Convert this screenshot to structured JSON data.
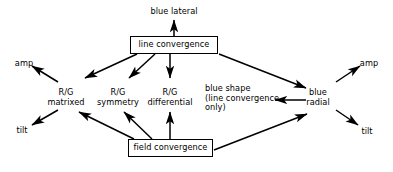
{
  "diagram": {
    "type": "flow-diagram",
    "title": "",
    "canvas": {
      "width": 393,
      "height": 172,
      "background": "#ffffff",
      "stroke": "#000000"
    },
    "boxes": [
      {
        "id": "line-convergence",
        "label": "line convergence",
        "x": 130,
        "y": 36,
        "w": 88,
        "h": 18
      },
      {
        "id": "field-convergence",
        "label": "field convergence",
        "x": 128,
        "y": 139,
        "w": 85,
        "h": 18
      }
    ],
    "labels": [
      {
        "id": "blue-lateral",
        "text": "blue lateral",
        "x": 174,
        "y": 7,
        "align": "center"
      },
      {
        "id": "amp-left",
        "text": "amp",
        "x": 24,
        "y": 59,
        "align": "center"
      },
      {
        "id": "tilt-left",
        "text": "tilt",
        "x": 22,
        "y": 126,
        "align": "center"
      },
      {
        "id": "amp-right",
        "text": "amp",
        "x": 369,
        "y": 59,
        "align": "center"
      },
      {
        "id": "tilt-right",
        "text": "tilt",
        "x": 367,
        "y": 127,
        "align": "center"
      },
      {
        "id": "rg-matrixed",
        "text": "R/G\nmatrixed",
        "x": 66,
        "y": 88,
        "align": "center"
      },
      {
        "id": "rg-symmetry",
        "text": "R/G\nsymmetry",
        "x": 118,
        "y": 88,
        "align": "center"
      },
      {
        "id": "rg-differential",
        "text": "R/G\ndifferential",
        "x": 170,
        "y": 88,
        "align": "center"
      },
      {
        "id": "blue-shape",
        "text": "blue shape\n(line convergence\nonly)",
        "x": 205,
        "y": 84,
        "align": "left"
      },
      {
        "id": "blue-radial",
        "text": "blue\nradial",
        "x": 318,
        "y": 88,
        "align": "center"
      }
    ],
    "edges": [
      {
        "id": "line-convergence-to-blue-lateral",
        "from": "line-convergence",
        "to": "blue-lateral",
        "x1": 174,
        "y1": 36,
        "x2": 174,
        "y2": 19
      },
      {
        "id": "line-convergence-to-rg-matrixed",
        "from": "line-convergence",
        "to": "rg-matrixed",
        "x1": 137,
        "y1": 54,
        "x2": 84,
        "y2": 79
      },
      {
        "id": "line-convergence-to-rg-symmetry",
        "from": "line-convergence",
        "to": "rg-symmetry",
        "x1": 155,
        "y1": 54,
        "x2": 128,
        "y2": 79
      },
      {
        "id": "line-convergence-to-rg-differential",
        "from": "line-convergence",
        "to": "rg-differential",
        "x1": 170,
        "y1": 54,
        "x2": 170,
        "y2": 79
      },
      {
        "id": "line-convergence-to-blue-radial",
        "from": "line-convergence",
        "to": "blue-radial",
        "x1": 219,
        "y1": 54,
        "x2": 307,
        "y2": 88
      },
      {
        "id": "field-convergence-to-rg-matrixed",
        "from": "field-convergence",
        "to": "rg-matrixed",
        "x1": 133,
        "y1": 139,
        "x2": 78,
        "y2": 112
      },
      {
        "id": "field-convergence-to-rg-symmetry",
        "from": "field-convergence",
        "to": "rg-symmetry",
        "x1": 151,
        "y1": 139,
        "x2": 123,
        "y2": 112
      },
      {
        "id": "field-convergence-to-rg-differential",
        "from": "field-convergence",
        "to": "rg-differential",
        "x1": 170,
        "y1": 139,
        "x2": 170,
        "y2": 112
      },
      {
        "id": "field-convergence-to-blue-radial",
        "from": "field-convergence",
        "to": "blue-radial",
        "x1": 214,
        "y1": 150,
        "x2": 308,
        "y2": 114
      },
      {
        "id": "blue-radial-to-blue-shape",
        "from": "blue-radial",
        "to": "blue-shape",
        "x1": 305,
        "y1": 100,
        "x2": 274,
        "y2": 100
      },
      {
        "id": "rg-matrixed-to-amp-left",
        "from": "rg-matrixed",
        "to": "amp-left",
        "x1": 57,
        "y1": 82,
        "x2": 31,
        "y2": 66
      },
      {
        "id": "rg-matrixed-to-tilt-left",
        "from": "rg-matrixed",
        "to": "tilt-left",
        "x1": 57,
        "y1": 110,
        "x2": 31,
        "y2": 125
      },
      {
        "id": "blue-radial-to-amp-right",
        "from": "blue-radial",
        "to": "amp-right",
        "x1": 336,
        "y1": 82,
        "x2": 360,
        "y2": 66
      },
      {
        "id": "blue-radial-to-tilt-right",
        "from": "blue-radial",
        "to": "tilt-right",
        "x1": 336,
        "y1": 110,
        "x2": 359,
        "y2": 125
      }
    ]
  }
}
